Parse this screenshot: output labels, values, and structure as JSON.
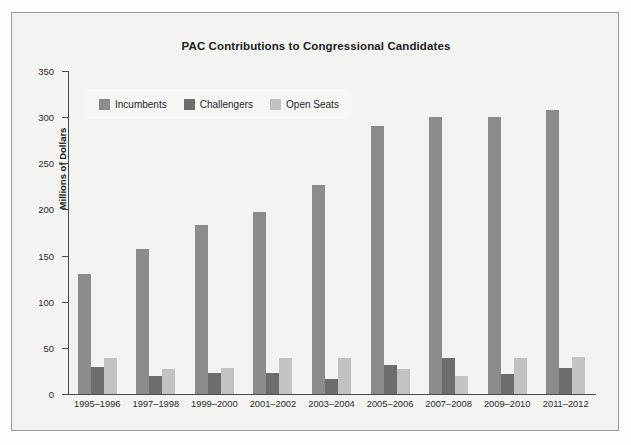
{
  "chart_data": {
    "type": "bar",
    "title": "PAC Contributions to Congressional Candidates",
    "xlabel": "",
    "ylabel": "Millions of Dollars",
    "ylim": [
      0,
      350
    ],
    "ytick_step": 50,
    "yticks": [
      0,
      50,
      100,
      150,
      200,
      250,
      300,
      350
    ],
    "grid": false,
    "legend_position": "top-left",
    "categories": [
      "1995–1996",
      "1997–1998",
      "1999–2000",
      "2001–2002",
      "2003–2004",
      "2005–2006",
      "2007–2008",
      "2009–2010",
      "2011–2012"
    ],
    "series": [
      {
        "name": "Incumbents",
        "color": "#8b8b8b",
        "values": [
          130,
          157,
          183,
          197,
          226,
          290,
          300,
          300,
          308
        ]
      },
      {
        "name": "Challengers",
        "color": "#6d6d6d",
        "values": [
          29,
          19,
          23,
          23,
          16,
          31,
          39,
          22,
          28
        ]
      },
      {
        "name": "Open Seats",
        "color": "#c2c2c2",
        "values": [
          39,
          27,
          28,
          39,
          39,
          27,
          20,
          39,
          40
        ]
      }
    ]
  },
  "figure": {
    "frame_border_color": "#9a9a9a",
    "background_color": "#f3f3f1",
    "axis_color": "#4a4a4a"
  }
}
